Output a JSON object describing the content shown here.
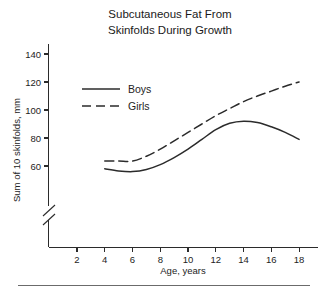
{
  "chart_data": {
    "type": "line",
    "title": "Subcutaneous Fat From Skinfolds During Growth",
    "title_lines": [
      "Subcutaneous Fat From",
      "Skinfolds During Growth"
    ],
    "xlabel": "Age, years",
    "ylabel": "Sum of 10 skinfolds, mm",
    "xlim": [
      0,
      19
    ],
    "ylim": [
      50,
      145
    ],
    "y_axis_break": true,
    "grid": false,
    "legend_position": "upper-left-inside",
    "xticks": [
      2,
      4,
      6,
      8,
      10,
      12,
      14,
      16,
      18
    ],
    "xtick_labels": [
      "2",
      "4",
      "6",
      "8",
      "10",
      "12",
      "14",
      "16",
      "18"
    ],
    "yticks": [
      60,
      80,
      100,
      120,
      140
    ],
    "ytick_labels": [
      "60",
      "80",
      "100",
      "120",
      "140"
    ],
    "x": [
      4,
      5,
      6,
      7,
      8,
      9,
      10,
      11,
      12,
      13,
      14,
      15,
      16,
      17,
      18
    ],
    "series": [
      {
        "name": "Boys",
        "style": "solid",
        "color": "#2b2b2b",
        "values": [
          58,
          56.5,
          56,
          57.5,
          61,
          66,
          72,
          79,
          86,
          90.5,
          92,
          91,
          88,
          84,
          79
        ]
      },
      {
        "name": "Girls",
        "style": "dashed",
        "color": "#2b2b2b",
        "values": [
          63.5,
          63.5,
          63.5,
          67,
          72,
          78,
          84,
          90,
          96,
          101,
          106,
          110,
          113.5,
          117,
          120
        ]
      }
    ],
    "legend": [
      {
        "label": "Boys",
        "style": "solid"
      },
      {
        "label": "Girls",
        "style": "dashed"
      }
    ]
  }
}
